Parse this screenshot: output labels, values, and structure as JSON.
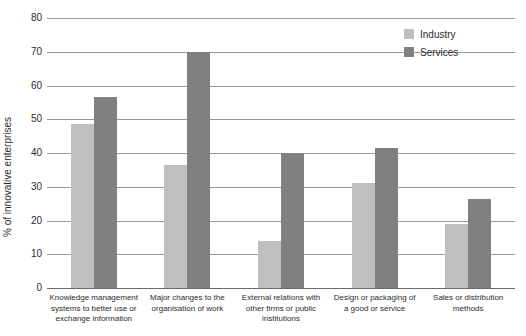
{
  "chart_data": {
    "type": "bar",
    "title": "",
    "subtitle": "",
    "xlabel": "",
    "ylabel": "% of innovative enterprises",
    "ylim": [
      0,
      80
    ],
    "ytick_step": 10,
    "yticks": [
      "80",
      "70",
      "60",
      "50",
      "40",
      "30",
      "20",
      "10",
      "0"
    ],
    "grid": true,
    "legend_position": "top-right",
    "categories": [
      "Knowledge management systems to better use or exchange information",
      "Major changes to the organisation of work",
      "External relations with other firms or public institutions",
      "Design or packaging of a good or service",
      "Sales or distribution methods"
    ],
    "category_lines": [
      [
        "Knowledge management",
        "systems to better use or",
        "exchange information"
      ],
      [
        "Major changes to the",
        "organisation of work"
      ],
      [
        "External relations with",
        "other firms or public",
        "institutions"
      ],
      [
        "Design or packaging of",
        "a good or service"
      ],
      [
        "Sales or distribution",
        "methods"
      ]
    ],
    "series": [
      {
        "name": "Industry",
        "color": "#bfbfbf",
        "values": [
          48.5,
          36.5,
          14,
          31,
          19
        ]
      },
      {
        "name": "Services",
        "color": "#808080",
        "values": [
          56.5,
          70,
          40,
          41.5,
          26.5
        ]
      }
    ]
  },
  "legend": {
    "items": [
      {
        "label": "Industry",
        "color": "#bfbfbf"
      },
      {
        "label": "Services",
        "color": "#808080"
      }
    ]
  }
}
